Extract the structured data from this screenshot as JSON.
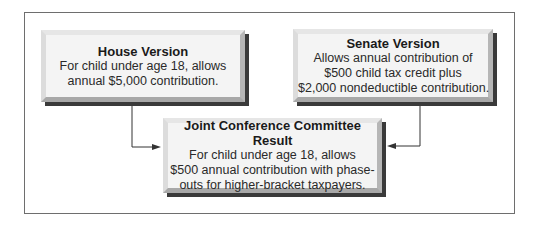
{
  "diagram": {
    "house": {
      "title": "House Version",
      "lines": [
        "For child under age 18, allows",
        "annual $5,000 contribution."
      ]
    },
    "senate": {
      "title": "Senate Version",
      "lines": [
        "Allows annual contribution of",
        "$500 child tax credit plus",
        "$2,000 nondeductible contribution."
      ]
    },
    "result": {
      "title": "Joint Conference Committee Result",
      "lines": [
        "For child under age 18, allows",
        "$500 annual contribution with phase-",
        "outs for higher-bracket taxpayers."
      ]
    },
    "connectors": [
      {
        "from": "house",
        "to": "result"
      },
      {
        "from": "senate",
        "to": "result"
      }
    ]
  }
}
